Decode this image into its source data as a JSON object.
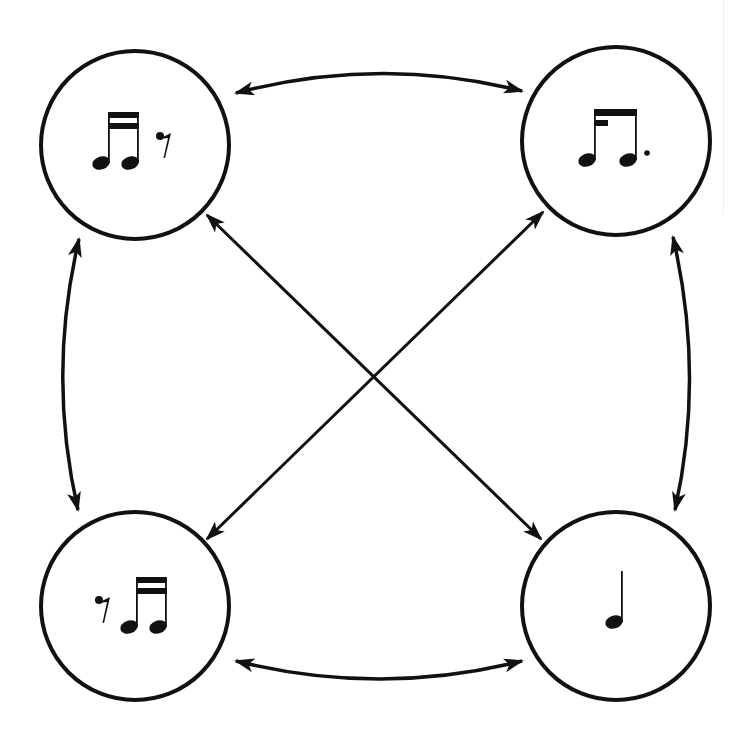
{
  "diagram": {
    "type": "rhythm-transformation-cycle",
    "stroke_color": "#111111",
    "background": "#ffffff",
    "nodes": [
      {
        "id": "top-left",
        "label": "two sixteenth notes + sixteenth rest",
        "cx": 135,
        "cy": 145,
        "r": 94
      },
      {
        "id": "top-right",
        "label": "eighth note + dotted eighth (sixteenth–dotted-eighth beam)",
        "cx": 616,
        "cy": 141,
        "r": 94
      },
      {
        "id": "bottom-left",
        "label": "sixteenth rest + two sixteenth notes",
        "cx": 135,
        "cy": 606,
        "r": 94
      },
      {
        "id": "bottom-right",
        "label": "quarter note",
        "cx": 616,
        "cy": 606,
        "r": 94
      }
    ],
    "edges": [
      {
        "from": "top-left",
        "to": "top-right",
        "bidirectional": true
      },
      {
        "from": "top-left",
        "to": "bottom-left",
        "bidirectional": true
      },
      {
        "from": "top-right",
        "to": "bottom-right",
        "bidirectional": true
      },
      {
        "from": "bottom-left",
        "to": "bottom-right",
        "bidirectional": true
      },
      {
        "from": "top-left",
        "to": "bottom-right",
        "bidirectional": true
      },
      {
        "from": "top-right",
        "to": "bottom-left",
        "bidirectional": true
      }
    ]
  }
}
